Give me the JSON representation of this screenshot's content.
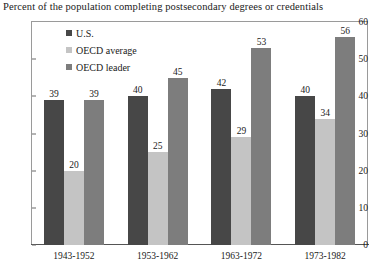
{
  "chart_data": {
    "type": "bar",
    "title": "Percent of the population completing postsecondary degrees or credentials",
    "xlabel": "",
    "ylabel": "",
    "ylim": [
      0,
      60
    ],
    "yticks": [
      0,
      10,
      20,
      30,
      40,
      50,
      60
    ],
    "grid": false,
    "legend_position": "top-left inside plot",
    "categories": [
      "1943-1952",
      "1953-1962",
      "1963-1972",
      "1973-1982"
    ],
    "series": [
      {
        "name": "U.S.",
        "color": "#474747",
        "values": [
          39,
          40,
          42,
          40
        ]
      },
      {
        "name": "OECD average",
        "color": "#c4c4c4",
        "values": [
          20,
          25,
          29,
          34
        ]
      },
      {
        "name": "OECD leader",
        "color": "#7d7d7d",
        "values": [
          39,
          45,
          53,
          56
        ]
      }
    ]
  }
}
